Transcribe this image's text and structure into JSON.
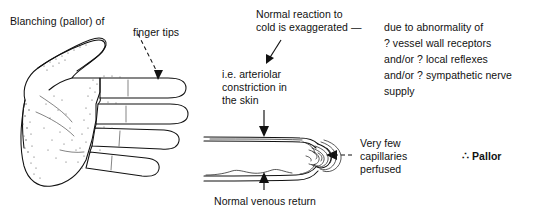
{
  "figure": {
    "background_color": "#ffffff",
    "ink_color": "#111111"
  },
  "labels": {
    "blanching": "Blanching (pallor) of",
    "finger_tips": "finger tips",
    "normal_reaction_line1": "Normal reaction to",
    "normal_reaction_line2": "cold is exaggerated —",
    "ie_line1": "i.e. arteriolar",
    "ie_line2": "constriction in",
    "ie_line3": "the skin",
    "due_line1": "due to abnormality of",
    "due_line2": "? vessel wall receptors",
    "due_line3": "and/or ? local reflexes",
    "due_line4": "and/or ? sympathetic nerve",
    "due_line5": "supply",
    "very_few_line1": "Very few",
    "very_few_line2": "capillaries",
    "very_few_line3": "perfused",
    "pallor": "∴ Pallor",
    "venous_return": "Normal venous return"
  },
  "diagram": {
    "hand_caption": "left hand palmar view line drawing with four fingers and thumb",
    "finger_schematic_caption": "longitudinal finger section with arterial inflow, capillary loops at tip, venous return"
  }
}
